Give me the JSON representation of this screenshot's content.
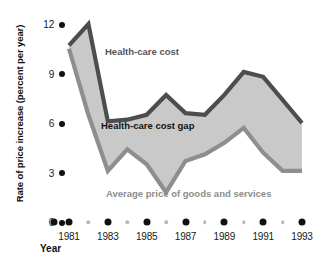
{
  "chart_data": {
    "type": "area",
    "title": "",
    "xlabel": "Year",
    "ylabel": "Rate of price increase (percent per year)",
    "xlim": [
      1981,
      1993
    ],
    "ylim": [
      0,
      12
    ],
    "yticks": [
      0,
      3,
      6,
      9,
      12
    ],
    "ytick_labels": [
      "0",
      "3",
      "6",
      "9",
      "12"
    ],
    "xticks": [
      1981,
      1983,
      1985,
      1987,
      1989,
      1991,
      1993
    ],
    "xtick_labels": [
      "1981",
      "1983",
      "1985",
      "1987",
      "1989",
      "1991",
      "1993"
    ],
    "xticks_minor": [
      1982,
      1984,
      1986,
      1988,
      1990,
      1992
    ],
    "grid": false,
    "legend_position": "inline-annotations",
    "x": [
      1981,
      1982,
      1983,
      1984,
      1985,
      1986,
      1987,
      1988,
      1989,
      1990,
      1991,
      1992,
      1993
    ],
    "series": [
      {
        "name": "Health-care cost",
        "color": "#4d4d4d",
        "values": [
          10.7,
          12.0,
          6.1,
          6.2,
          6.5,
          7.7,
          6.6,
          6.5,
          7.7,
          9.1,
          8.8,
          7.4,
          6.0
        ]
      },
      {
        "name": "Average price of goods and services",
        "color": "#8e8e8e",
        "values": [
          10.5,
          6.5,
          3.1,
          4.4,
          3.5,
          1.8,
          3.7,
          4.1,
          4.8,
          5.7,
          4.2,
          3.1,
          3.1
        ]
      }
    ],
    "fill_between": {
      "label": "Health-care cost gap",
      "color": "#c9c9c9",
      "between": [
        "Health-care cost",
        "Average price of goods and services"
      ]
    },
    "annotations": [
      {
        "text": "Health-care cost",
        "color": "#575757"
      },
      {
        "text": "Health-care cost gap",
        "color": "#111111"
      },
      {
        "text": "Average price of goods and services",
        "color": "#8d8d8d"
      }
    ]
  },
  "axes": {
    "y_title": "Rate of price increase (percent per year)",
    "x_title": "Year"
  },
  "labels": {
    "upper_curve": "Health-care cost",
    "gap_region": "Health-care cost gap",
    "lower_curve": "Average price of goods and services"
  },
  "colors": {
    "upper_stroke": "#4d4d4d",
    "lower_stroke": "#8e8e8e",
    "gap_fill": "#c9c9c9",
    "tick_dot": "#111111",
    "minor_dot": "#b9b9b9",
    "background": "#ffffff"
  }
}
